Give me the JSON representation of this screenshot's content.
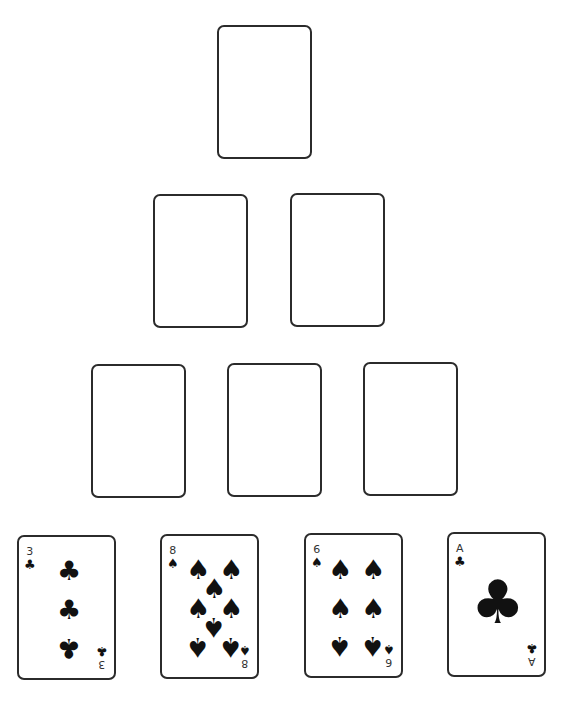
{
  "pyramid": {
    "rows": [
      {
        "slots": [
          {
            "x": 217,
            "y": 25
          }
        ]
      },
      {
        "slots": [
          {
            "x": 153,
            "y": 194
          },
          {
            "x": 290,
            "y": 193
          }
        ]
      },
      {
        "slots": [
          {
            "x": 91,
            "y": 364
          },
          {
            "x": 227,
            "y": 363
          },
          {
            "x": 363,
            "y": 362
          }
        ]
      }
    ]
  },
  "hand": [
    {
      "rank": "3",
      "suit": "clubs",
      "symbol": "♣",
      "x": 17,
      "y": 535,
      "pips": [
        {
          "x": 50,
          "y": 33,
          "flip": false
        },
        {
          "x": 50,
          "y": 72,
          "flip": false
        },
        {
          "x": 50,
          "y": 111,
          "flip": true
        }
      ]
    },
    {
      "rank": "8",
      "suit": "spades",
      "symbol": "♠",
      "x": 160,
      "y": 534,
      "pips": [
        {
          "x": 36,
          "y": 33,
          "flip": false
        },
        {
          "x": 69,
          "y": 33,
          "flip": false
        },
        {
          "x": 52,
          "y": 52,
          "flip": false
        },
        {
          "x": 36,
          "y": 72,
          "flip": false
        },
        {
          "x": 69,
          "y": 72,
          "flip": false
        },
        {
          "x": 52,
          "y": 91,
          "flip": true
        },
        {
          "x": 36,
          "y": 111,
          "flip": true
        },
        {
          "x": 69,
          "y": 111,
          "flip": true
        }
      ]
    },
    {
      "rank": "6",
      "suit": "spades",
      "symbol": "♠",
      "x": 304,
      "y": 533,
      "pips": [
        {
          "x": 34,
          "y": 34,
          "flip": false
        },
        {
          "x": 67,
          "y": 34,
          "flip": false
        },
        {
          "x": 34,
          "y": 73,
          "flip": false
        },
        {
          "x": 67,
          "y": 73,
          "flip": false
        },
        {
          "x": 34,
          "y": 111,
          "flip": true
        },
        {
          "x": 67,
          "y": 111,
          "flip": true
        }
      ]
    },
    {
      "rank": "A",
      "suit": "clubs",
      "symbol": "♣",
      "x": 447,
      "y": 532,
      "pips": [
        {
          "x": 49,
          "y": 68,
          "flip": false,
          "big": true
        }
      ]
    }
  ]
}
